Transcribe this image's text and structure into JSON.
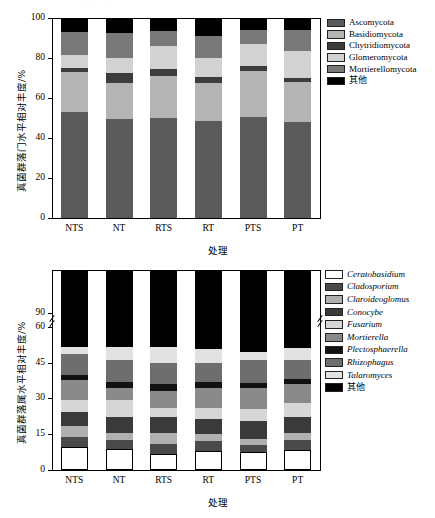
{
  "figure": {
    "background": "#ffffff",
    "partial_top_text": "· · · · · · · · · · · · · · · ·"
  },
  "chart_data": [
    {
      "id": "fungal-phylum-chart",
      "type": "bar",
      "stacked": true,
      "title": "",
      "xlabel": "处理",
      "ylabel": "真菌群落门水平相对丰度/%",
      "ylim": [
        0,
        100
      ],
      "yticks": [
        0,
        20,
        40,
        60,
        80,
        100
      ],
      "grid": false,
      "legend_position": "right",
      "categories": [
        "NTS",
        "NT",
        "RTS",
        "RT",
        "PTS",
        "PT"
      ],
      "series": [
        {
          "name": "Ascomycota",
          "color": "#5a5a5a",
          "values": [
            53.0,
            49.5,
            50.2,
            48.5,
            50.5,
            47.8
          ]
        },
        {
          "name": "Basidiomycota",
          "color": "#b4b4b4",
          "values": [
            19.8,
            18.2,
            21.0,
            19.0,
            23.0,
            20.2
          ]
        },
        {
          "name": "Chytridiomycota",
          "color": "#3c3c3c",
          "values": [
            2.0,
            4.6,
            3.2,
            3.2,
            2.3,
            2.0
          ]
        },
        {
          "name": "Glomeromycota",
          "color": "#d2d2d2",
          "values": [
            6.6,
            7.7,
            11.4,
            9.1,
            11.4,
            13.6
          ]
        },
        {
          "name": "Mortierellomycota",
          "color": "#787878",
          "values": [
            11.6,
            12.5,
            7.6,
            11.4,
            7.0,
            10.4
          ]
        },
        {
          "name": "其他",
          "color": "#000000",
          "values": [
            7.0,
            7.5,
            6.6,
            8.8,
            5.8,
            6.0
          ]
        }
      ]
    },
    {
      "id": "fungal-genus-chart",
      "type": "bar",
      "stacked": true,
      "title": "",
      "xlabel": "处理",
      "ylabel": "真菌群落属水平相对丰度/%",
      "ylim": [
        0,
        100
      ],
      "yticks": [
        0,
        15,
        30,
        45,
        60,
        90
      ],
      "axis_break": {
        "from": 62,
        "to": 88
      },
      "grid": false,
      "legend_position": "right",
      "categories": [
        "NTS",
        "NT",
        "RTS",
        "RT",
        "PTS",
        "PT"
      ],
      "series": [
        {
          "name": "Ceratobasidium",
          "color": "#ffffff",
          "values": [
            9.5,
            9.0,
            6.5,
            8.0,
            7.5,
            8.5
          ]
        },
        {
          "name": "Cladosporium",
          "color": "#4a4a4a",
          "values": [
            4.5,
            3.5,
            4.5,
            4.0,
            3.0,
            4.0
          ]
        },
        {
          "name": "Claroideoglomus",
          "color": "#b0b0b0",
          "values": [
            4.5,
            3.0,
            4.5,
            3.0,
            2.5,
            3.0
          ]
        },
        {
          "name": "Conocybe",
          "color": "#3a3a3a",
          "values": [
            6.0,
            6.5,
            6.5,
            6.5,
            7.5,
            6.5
          ]
        },
        {
          "name": "Fusarium",
          "color": "#d6d6d6",
          "values": [
            5.0,
            7.5,
            4.0,
            4.5,
            5.0,
            6.0
          ]
        },
        {
          "name": "Mortierella",
          "color": "#8a8a8a",
          "values": [
            8.0,
            5.0,
            7.0,
            8.5,
            9.0,
            8.0
          ]
        },
        {
          "name": "Plectosphaerella",
          "color": "#111111",
          "values": [
            2.5,
            2.5,
            3.0,
            2.5,
            2.0,
            2.0
          ]
        },
        {
          "name": "Rhizophagus",
          "color": "#6e6e6e",
          "values": [
            8.5,
            9.0,
            9.0,
            8.0,
            9.5,
            8.0
          ]
        },
        {
          "name": "Talaromyces",
          "color": "#e2e2e2",
          "values": [
            3.0,
            5.5,
            6.5,
            5.5,
            3.5,
            5.0
          ]
        },
        {
          "name": "其他",
          "color": "#000000",
          "values": [
            48.5,
            48.5,
            48.5,
            49.5,
            50.5,
            49.0
          ]
        }
      ]
    }
  ],
  "top_chart": {
    "ylabel": "真菌群落门水平相对丰度/%",
    "xlabel": "处理",
    "ytick_labels": [
      "0",
      "20",
      "40",
      "60",
      "80",
      "100"
    ],
    "xtick_labels": [
      "NTS",
      "NT",
      "RTS",
      "RT",
      "PTS",
      "PT"
    ],
    "legend": [
      {
        "label": "Ascomycota",
        "color": "#5a5a5a"
      },
      {
        "label": "Basidiomycota",
        "color": "#b4b4b4"
      },
      {
        "label": "Chytridiomycota",
        "color": "#3c3c3c"
      },
      {
        "label": "Glomeromycota",
        "color": "#d2d2d2"
      },
      {
        "label": "Mortierellomycota",
        "color": "#787878"
      },
      {
        "label": "其他",
        "color": "#000000"
      }
    ]
  },
  "bottom_chart": {
    "ylabel": "真菌群落属水平相对丰度/%",
    "xlabel": "处理",
    "ytick_labels": [
      "0",
      "15",
      "30",
      "45",
      "60",
      "90"
    ],
    "xtick_labels": [
      "NTS",
      "NT",
      "RTS",
      "RT",
      "PTS",
      "PT"
    ],
    "legend": [
      {
        "label": "Ceratobasidium",
        "color": "#ffffff"
      },
      {
        "label": "Cladosporium",
        "color": "#4a4a4a"
      },
      {
        "label": "Claroideoglomus",
        "color": "#b0b0b0"
      },
      {
        "label": "Conocybe",
        "color": "#3a3a3a"
      },
      {
        "label": "Fusarium",
        "color": "#d6d6d6"
      },
      {
        "label": "Mortierella",
        "color": "#8a8a8a"
      },
      {
        "label": "Plectosphaerella",
        "color": "#111111"
      },
      {
        "label": "Rhizophagus",
        "color": "#6e6e6e"
      },
      {
        "label": "Talaromyces",
        "color": "#e2e2e2"
      },
      {
        "label": "其他",
        "color": "#000000"
      }
    ]
  }
}
